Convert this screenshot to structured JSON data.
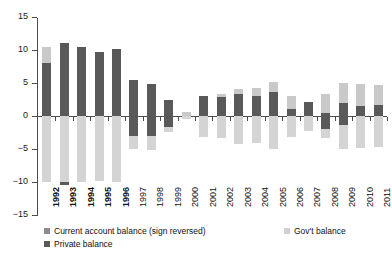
{
  "chart_data": {
    "type": "bar",
    "title": "",
    "subtitle": "",
    "xlabel": "",
    "ylabel": "",
    "ylim": [
      -15,
      15
    ],
    "yticks": [
      15,
      10,
      5,
      0,
      -5,
      -10,
      -15
    ],
    "ytick_labels": [
      "15",
      "10",
      "5",
      "0",
      "−5",
      "−10",
      "−15"
    ],
    "grid": false,
    "stacked": true,
    "legend_position": "bottom",
    "categories": [
      "1992",
      "1993",
      "1994",
      "1995",
      "1996",
      "1997",
      "1998",
      "1999",
      "2000",
      "2001",
      "2002",
      "2003",
      "2004",
      "2005",
      "2006",
      "2007",
      "2008",
      "2009",
      "2010",
      "2011"
    ],
    "series": [
      {
        "name": "Current account balance (sign reversed)",
        "color": "#c9c9c9",
        "values": [
          10.5,
          11.0,
          10.4,
          9.7,
          10.1,
          5.4,
          4.9,
          2.4,
          0.6,
          3.1,
          3.3,
          4.1,
          4.2,
          5.1,
          3.1,
          2.1,
          3.3,
          5.0,
          4.9,
          4.7
        ]
      },
      {
        "name": "Gov't balance",
        "color": "#d4d4d4",
        "values": [
          -10.0,
          -10.5,
          -10.0,
          -9.8,
          -10.0,
          -5.0,
          -5.1,
          -2.4,
          -0.5,
          -3.2,
          -3.3,
          -4.2,
          -4.1,
          -5.0,
          -3.2,
          -2.2,
          -3.4,
          -5.0,
          -4.9,
          -4.7
        ]
      },
      {
        "name": "Private balance",
        "color": "#595959",
        "values": [
          8.0,
          11.0,
          10.4,
          9.7,
          10.1,
          5.4,
          4.9,
          2.4,
          0.6,
          3.1,
          3.3,
          4.1,
          4.2,
          3.6,
          3.1,
          2.1,
          1.6,
          2.0,
          1.5,
          1.7
        ]
      }
    ],
    "bars": [
      {
        "year": "1992",
        "bold": true,
        "pos_dark_top": 8.0,
        "pos_light_top": 10.5,
        "neg_light_bottom": -10.0,
        "neg_dark_bottom": 0.0
      },
      {
        "year": "1993",
        "bold": true,
        "pos_dark_top": 11.0,
        "pos_light_top": 11.0,
        "neg_light_bottom": -10.0,
        "neg_dark_bottom": -10.5
      },
      {
        "year": "1994",
        "bold": true,
        "pos_dark_top": 10.4,
        "pos_light_top": 10.4,
        "neg_light_bottom": -10.0,
        "neg_dark_bottom": 0.0
      },
      {
        "year": "1995",
        "bold": true,
        "pos_dark_top": 9.7,
        "pos_light_top": 9.7,
        "neg_light_bottom": -9.8,
        "neg_dark_bottom": 0.0
      },
      {
        "year": "1996",
        "bold": true,
        "pos_dark_top": 10.1,
        "pos_light_top": 10.1,
        "neg_light_bottom": -10.0,
        "neg_dark_bottom": 0.0
      },
      {
        "year": "1997",
        "bold": false,
        "pos_dark_top": 5.4,
        "pos_light_top": 5.4,
        "neg_light_bottom": -5.0,
        "neg_dark_bottom": -3.0
      },
      {
        "year": "1998",
        "bold": false,
        "pos_dark_top": 4.9,
        "pos_light_top": 4.9,
        "neg_light_bottom": -5.1,
        "neg_dark_bottom": -3.1
      },
      {
        "year": "1999",
        "bold": false,
        "pos_dark_top": 2.4,
        "pos_light_top": 2.4,
        "neg_light_bottom": -2.4,
        "neg_dark_bottom": -1.6
      },
      {
        "year": "2000",
        "bold": false,
        "pos_dark_top": 0.0,
        "pos_light_top": 0.6,
        "neg_light_bottom": -0.5,
        "neg_dark_bottom": 0.0
      },
      {
        "year": "2001",
        "bold": false,
        "pos_dark_top": 3.1,
        "pos_light_top": 3.1,
        "neg_light_bottom": -3.2,
        "neg_dark_bottom": 0.0
      },
      {
        "year": "2002",
        "bold": false,
        "pos_dark_top": 2.9,
        "pos_light_top": 3.3,
        "neg_light_bottom": -3.3,
        "neg_dark_bottom": 0.0
      },
      {
        "year": "2003",
        "bold": false,
        "pos_dark_top": 3.3,
        "pos_light_top": 4.1,
        "neg_light_bottom": -4.2,
        "neg_dark_bottom": 0.0
      },
      {
        "year": "2004",
        "bold": false,
        "pos_dark_top": 3.1,
        "pos_light_top": 4.2,
        "neg_light_bottom": -4.1,
        "neg_dark_bottom": 0.0
      },
      {
        "year": "2005",
        "bold": false,
        "pos_dark_top": 3.6,
        "pos_light_top": 5.1,
        "neg_light_bottom": -5.0,
        "neg_dark_bottom": 0.0
      },
      {
        "year": "2006",
        "bold": false,
        "pos_dark_top": 1.1,
        "pos_light_top": 3.1,
        "neg_light_bottom": -3.2,
        "neg_dark_bottom": 0.0
      },
      {
        "year": "2007",
        "bold": false,
        "pos_dark_top": 2.1,
        "pos_light_top": 2.1,
        "neg_light_bottom": -2.2,
        "neg_dark_bottom": 0.0
      },
      {
        "year": "2008",
        "bold": false,
        "pos_dark_top": 0.5,
        "pos_light_top": 3.3,
        "neg_light_bottom": -3.4,
        "neg_dark_bottom": -2.0
      },
      {
        "year": "2009",
        "bold": false,
        "pos_dark_top": 2.0,
        "pos_light_top": 5.0,
        "neg_light_bottom": -5.0,
        "neg_dark_bottom": -1.3
      },
      {
        "year": "2010",
        "bold": false,
        "pos_dark_top": 1.5,
        "pos_light_top": 4.9,
        "neg_light_bottom": -4.9,
        "neg_dark_bottom": 0.0
      },
      {
        "year": "2011",
        "bold": false,
        "pos_dark_top": 1.7,
        "pos_light_top": 4.7,
        "neg_light_bottom": -4.7,
        "neg_dark_bottom": 0.0
      }
    ]
  },
  "legend": {
    "items": [
      {
        "label": "Current account balance (sign reversed)",
        "color": "#8c8c8c"
      },
      {
        "label": "Gov't balance",
        "color": "#d0d0d0"
      },
      {
        "label": "Private balance",
        "color": "#595959"
      }
    ]
  }
}
